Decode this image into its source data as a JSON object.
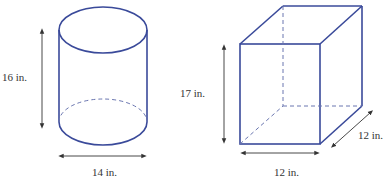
{
  "figures": {
    "cylinder": {
      "shape": "cylinder",
      "height_label": "16 in.",
      "diameter_label": "14 in."
    },
    "box": {
      "shape": "rectangular-prism",
      "height_label": "17 in.",
      "width_label": "12 in.",
      "depth_label": "12 in."
    }
  },
  "colors": {
    "outline": "#3a4a9a",
    "dimension": "#333333"
  }
}
